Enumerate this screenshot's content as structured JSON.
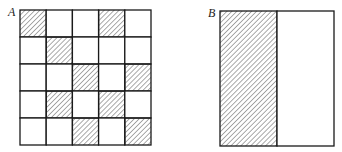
{
  "figure_a": {
    "label": "A",
    "rows": 5,
    "cols": 5,
    "shaded_cells": [
      [
        0,
        0
      ],
      [
        0,
        3
      ],
      [
        1,
        1
      ],
      [
        2,
        2
      ],
      [
        2,
        4
      ],
      [
        3,
        1
      ],
      [
        3,
        3
      ],
      [
        4,
        2
      ],
      [
        4,
        4
      ]
    ]
  },
  "figure_b": {
    "label": "B",
    "parts": 2,
    "shaded_parts": [
      0
    ]
  },
  "colors": {
    "line": "#1a1a1a",
    "hatch": "#555555",
    "background": "#ffffff"
  }
}
